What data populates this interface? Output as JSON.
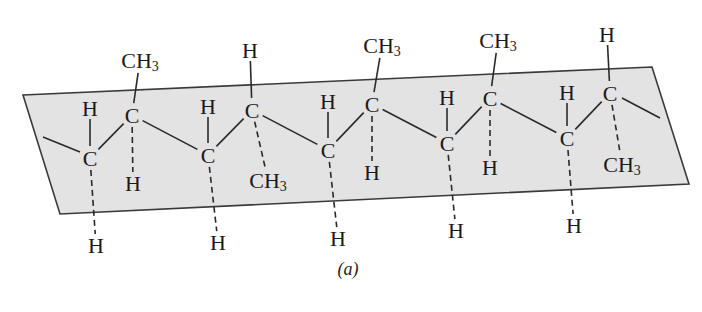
{
  "figure": {
    "caption": "(a)",
    "caption_pos": [
      348,
      275
    ],
    "plane": {
      "points": "23,95 652,67 689,184 60,214",
      "fill": "#e3e3e3",
      "stroke": "#3a3a3a"
    },
    "end_bonds": [
      {
        "from": [
          43,
          137
        ],
        "to": [
          80,
          152
        ]
      },
      {
        "from": [
          622,
          98
        ],
        "to": [
          660,
          118
        ]
      }
    ],
    "backbone": [
      {
        "id": "C1",
        "label": "C",
        "pos": [
          90,
          158
        ],
        "up": {
          "label": "H",
          "pos": [
            90,
            108
          ],
          "type": "solid"
        },
        "down": {
          "label": "H",
          "pos": [
            96,
            245
          ],
          "type": "dash"
        }
      },
      {
        "id": "C2",
        "label": "C",
        "pos": [
          132,
          115
        ],
        "up": {
          "label": "CH",
          "sub": "3",
          "pos": [
            140,
            60
          ],
          "type": "solid"
        },
        "down": {
          "label": "H",
          "pos": [
            133,
            183
          ],
          "type": "dash"
        }
      },
      {
        "id": "C3",
        "label": "C",
        "pos": [
          208,
          155
        ],
        "up": {
          "label": "H",
          "pos": [
            208,
            106
          ],
          "type": "solid"
        },
        "down": {
          "label": "H",
          "pos": [
            218,
            242
          ],
          "type": "dash"
        }
      },
      {
        "id": "C4",
        "label": "C",
        "pos": [
          252,
          110
        ],
        "up": {
          "label": "H",
          "pos": [
            250,
            50
          ],
          "type": "solid"
        },
        "down": {
          "label": "CH",
          "sub": "3",
          "pos": [
            268,
            180
          ],
          "type": "dash"
        }
      },
      {
        "id": "C5",
        "label": "C",
        "pos": [
          328,
          150
        ],
        "up": {
          "label": "H",
          "pos": [
            328,
            101
          ],
          "type": "solid"
        },
        "down": {
          "label": "H",
          "pos": [
            338,
            238
          ],
          "type": "dash"
        }
      },
      {
        "id": "C6",
        "label": "C",
        "pos": [
          372,
          104
        ],
        "up": {
          "label": "CH",
          "sub": "3",
          "pos": [
            382,
            45
          ],
          "type": "solid"
        },
        "down": {
          "label": "H",
          "pos": [
            372,
            172
          ],
          "type": "dash"
        }
      },
      {
        "id": "C7",
        "label": "C",
        "pos": [
          447,
          143
        ],
        "up": {
          "label": "H",
          "pos": [
            447,
            97
          ],
          "type": "solid"
        },
        "down": {
          "label": "H",
          "pos": [
            456,
            230
          ],
          "type": "dash"
        }
      },
      {
        "id": "C8",
        "label": "C",
        "pos": [
          490,
          98
        ],
        "up": {
          "label": "CH",
          "sub": "3",
          "pos": [
            498,
            40
          ],
          "type": "solid"
        },
        "down": {
          "label": "H",
          "pos": [
            490,
            167
          ],
          "type": "dash"
        }
      },
      {
        "id": "C9",
        "label": "C",
        "pos": [
          567,
          138
        ],
        "up": {
          "label": "H",
          "pos": [
            567,
            92
          ],
          "type": "solid"
        },
        "down": {
          "label": "H",
          "pos": [
            574,
            225
          ],
          "type": "dash"
        }
      },
      {
        "id": "C10",
        "label": "C",
        "pos": [
          610,
          93
        ],
        "up": {
          "label": "H",
          "pos": [
            607,
            34
          ],
          "type": "solid"
        },
        "down": {
          "label": "CH",
          "sub": "3",
          "pos": [
            622,
            164
          ],
          "type": "dash"
        }
      }
    ]
  }
}
